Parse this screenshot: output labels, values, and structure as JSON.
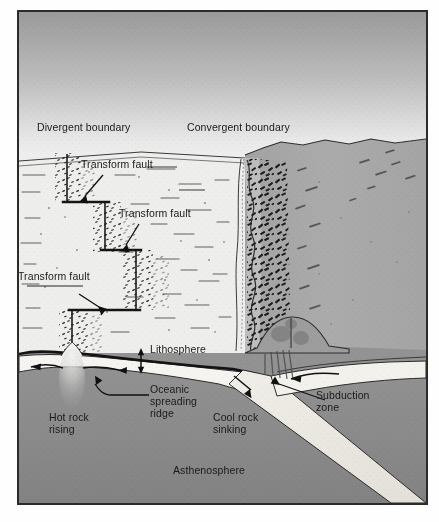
{
  "figure": {
    "type": "diagram",
    "orientation": "oblique block diagram, oceanic plate on left, continent on right"
  },
  "labels": {
    "divergent_boundary": "Divergent boundary",
    "convergent_boundary": "Convergent boundary",
    "transform_fault_1": "Transform fault",
    "transform_fault_2": "Transform fault",
    "transform_fault_3": "Transform fault",
    "lithosphere": "Lithosphere",
    "oceanic_spreading_ridge_l1": "Oceanic",
    "oceanic_spreading_ridge_l2": "spreading",
    "oceanic_spreading_ridge_l3": "ridge",
    "hot_rock_rising_l1": "Hot rock",
    "hot_rock_rising_l2": "rising",
    "cool_rock_sinking_l1": "Cool rock",
    "cool_rock_sinking_l2": "sinking",
    "subduction_zone_l1": "Subduction",
    "subduction_zone_l2": "zone",
    "asthenosphere": "Asthenosphere"
  },
  "colors": {
    "frame_border": "#2b2b2b",
    "sky_top": "#9e9e9e",
    "sky_bottom": "#ededed",
    "ocean_floor": "#efefef",
    "continent": "#a8a8a8",
    "shelf": "#c4c4c4",
    "asthenosphere": "#8f8f8f",
    "asthenosphere_deep": "#838383",
    "lithosphere": "#f4f4f2",
    "slab": "#eceae4",
    "ink": "#1a1a1a",
    "plume": "#dcdcdc"
  },
  "features": {
    "sky": "vertical gradient gray to light gray",
    "seafloor": "stippled ridge-axis bands with abyssal-hill dashes",
    "mountains": "dense dark hachure band along continental coast",
    "trench": "wiggly double line at ocean-continent contact",
    "arrows": [
      {
        "name": "spreading-left",
        "direction": "left"
      },
      {
        "name": "spreading-right",
        "direction": "right"
      },
      {
        "name": "lithosphere-thickness",
        "direction": "vertical double"
      },
      {
        "name": "slab-descent",
        "direction": "down-right"
      },
      {
        "name": "continental-plate",
        "direction": "left"
      }
    ],
    "transform_fault_count": 3
  }
}
